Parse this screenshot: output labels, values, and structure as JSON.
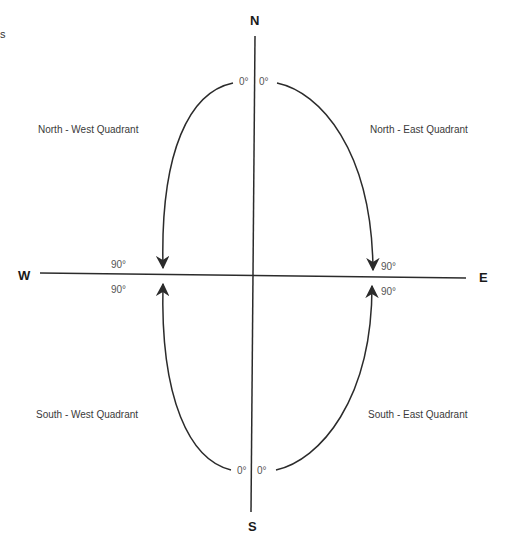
{
  "diagram": {
    "cropped_fragment": "s",
    "cardinals": {
      "north": "N",
      "south": "S",
      "west": "W",
      "east": "E"
    },
    "quadrants": {
      "north_west": "North - West Quadrant",
      "north_east": "North - East Quadrant",
      "south_west": "South - West Quadrant",
      "south_east": "South - East Quadrant"
    },
    "angles": {
      "nw_start": "0°",
      "ne_start": "0°",
      "sw_start": "0°",
      "se_start": "0°",
      "nw_end": "90°",
      "ne_end": "90°",
      "sw_end": "90°",
      "se_end": "90°"
    },
    "colors": {
      "line": "#2b2b2b",
      "text": "#3a3a3a",
      "background": "#ffffff"
    }
  }
}
